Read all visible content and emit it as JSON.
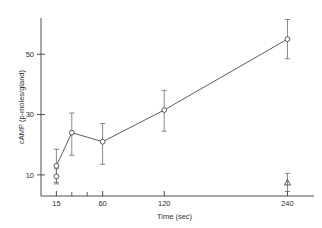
{
  "chart_data": {
    "type": "line",
    "title": "",
    "xlabel": "Time (sec)",
    "ylabel": "cAMP (p-moles/gland)",
    "xlim": [
      0,
      260
    ],
    "ylim": [
      3,
      62
    ],
    "grid": false,
    "legend": "none",
    "x_ticks": [
      {
        "value": 15,
        "label": "15"
      },
      {
        "value": 30,
        "label": ""
      },
      {
        "value": 45,
        "label": ""
      },
      {
        "value": 60,
        "label": "60"
      },
      {
        "value": 120,
        "label": "120"
      },
      {
        "value": 240,
        "label": "240"
      }
    ],
    "y_ticks": [
      {
        "value": 10,
        "label": "10"
      },
      {
        "value": 30,
        "label": "30"
      },
      {
        "value": 50,
        "label": "50"
      }
    ],
    "series": [
      {
        "name": "cAMP time course",
        "marker": "open-circle",
        "connected": true,
        "points": [
          {
            "x": 15,
            "y": 13,
            "err_low": 5.5,
            "err_high": 5.5
          },
          {
            "x": 30,
            "y": 24,
            "err_low": 7.5,
            "err_high": 6.5
          },
          {
            "x": 60,
            "y": 21,
            "err_low": 7.5,
            "err_high": 6.0
          },
          {
            "x": 120,
            "y": 31.5,
            "err_low": 7.0,
            "err_high": 6.5
          },
          {
            "x": 240,
            "y": 55,
            "err_low": 6.5,
            "err_high": 6.5
          }
        ]
      },
      {
        "name": "control 15 sec",
        "marker": "open-circle",
        "connected": false,
        "points": [
          {
            "x": 15,
            "y": 9.5,
            "err_low": 2.5,
            "err_high": 2.5
          }
        ]
      },
      {
        "name": "control 240 sec",
        "marker": "open-triangle",
        "connected": false,
        "points": [
          {
            "x": 240,
            "y": 7.5,
            "err_low": 3.0,
            "err_high": 3.0
          }
        ]
      }
    ]
  }
}
